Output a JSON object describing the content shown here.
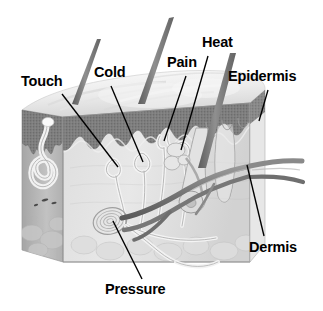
{
  "figure": {
    "kind": "anatomical-illustration",
    "background_color": "#ffffff",
    "label_color": "#000000",
    "leader_line_color": "#000000"
  },
  "labels": [
    {
      "id": "touch",
      "text": "Touch",
      "x": 21,
      "y": 74,
      "leader": {
        "x1": 62,
        "y1": 94,
        "x2": 118,
        "y2": 167
      }
    },
    {
      "id": "cold",
      "text": "Cold",
      "x": 94,
      "y": 65,
      "leader": {
        "x1": 111,
        "y1": 86,
        "x2": 143,
        "y2": 162
      }
    },
    {
      "id": "pain",
      "text": "Pain",
      "x": 167,
      "y": 55,
      "leader": {
        "x1": 186,
        "y1": 76,
        "x2": 164,
        "y2": 141
      }
    },
    {
      "id": "heat",
      "text": "Heat",
      "x": 202,
      "y": 35,
      "leader": {
        "x1": 208,
        "y1": 56,
        "x2": 181,
        "y2": 150
      }
    },
    {
      "id": "epidermis",
      "text": "Epidermis",
      "x": 228,
      "y": 69,
      "leader": {
        "x1": 268,
        "y1": 90,
        "x2": 259,
        "y2": 121
      }
    },
    {
      "id": "dermis",
      "text": "Dermis",
      "x": 249,
      "y": 240,
      "leader": {
        "x1": 264,
        "y1": 236,
        "x2": 247,
        "y2": 165
      }
    },
    {
      "id": "pressure",
      "text": "Pressure",
      "x": 105,
      "y": 282,
      "leader": {
        "x1": 142,
        "y1": 279,
        "x2": 113,
        "y2": 221
      }
    }
  ],
  "structures": {
    "block": {
      "name": "skin-block",
      "epidermis_band_color": "#7b7b7b",
      "dermis_fill_color": "#cfcfcf",
      "left_face_color": "#b9b9b9",
      "top_surface_color": "#efefef",
      "outline_color": "#555555"
    },
    "hairs": [
      {
        "name": "hair-shaft-left",
        "tip_x": 99,
        "tip_y": 40,
        "base_x": 74,
        "base_y": 103
      },
      {
        "name": "hair-shaft-middle",
        "tip_x": 172,
        "tip_y": 18,
        "base_x": 140,
        "base_y": 103
      },
      {
        "name": "hair-shaft-right",
        "tip_x": 233,
        "tip_y": 54,
        "base_x": 200,
        "base_y": 165
      }
    ],
    "receptors": [
      {
        "name": "pacinian-corpuscle",
        "role": "pressure",
        "cx": 110,
        "cy": 221
      },
      {
        "name": "sweat-gland",
        "role": "secretion",
        "cx": 52,
        "cy": 165
      },
      {
        "name": "free-nerve-ending",
        "role": "pain",
        "cx": 164,
        "cy": 141
      },
      {
        "name": "meissner-corpuscle",
        "role": "touch",
        "cx": 118,
        "cy": 167
      },
      {
        "name": "krause-end-bulb",
        "role": "cold",
        "cx": 143,
        "cy": 162
      },
      {
        "name": "ruffini-ending",
        "role": "heat",
        "cx": 181,
        "cy": 150
      }
    ],
    "vessels": [
      {
        "name": "blood-vessel-upper",
        "color": "#8e8e8e"
      },
      {
        "name": "blood-vessel-lower",
        "color": "#6f6f6f"
      }
    ]
  }
}
